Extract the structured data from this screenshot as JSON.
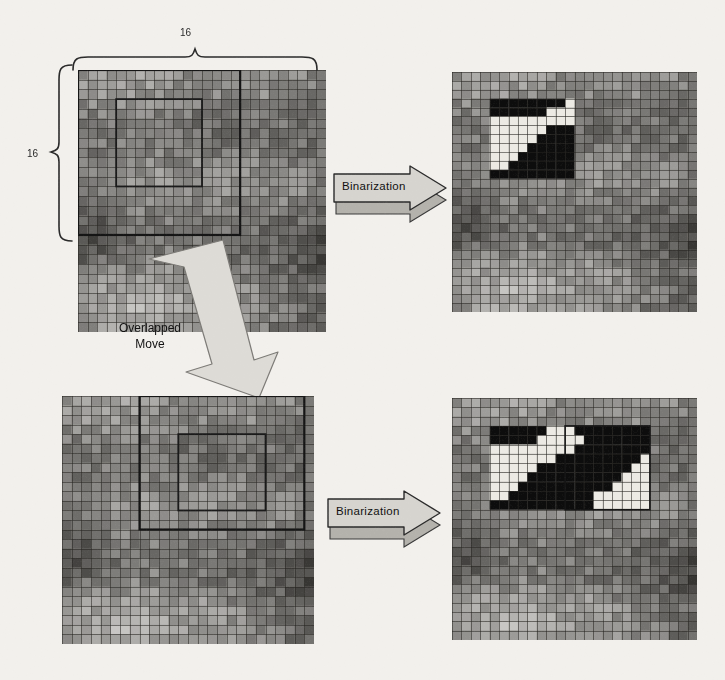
{
  "figure": {
    "background_color": "#f2f0ec",
    "ink_color": "#1d1d1d",
    "arrow_fill": "#c9c7c2",
    "arrow_stroke": "#2a2a2a",
    "panel_border": "#202020"
  },
  "dimensions": {
    "width_label": "16",
    "height_label": "16"
  },
  "labels": {
    "binarization_top": "Binarization",
    "binarization_bottom": "Binarization",
    "overlapped_line1": "Overlapped",
    "overlapped_line2": "Move"
  },
  "panels": [
    {
      "id": "source-top",
      "name": "top-left-source-grid",
      "role": "grayscale texture with 16x16 analysis window",
      "x": 78,
      "y": 70,
      "w": 248,
      "h": 262,
      "grid_cols": 26,
      "grid_rows": 27,
      "window": {
        "x": 0,
        "y": 0,
        "w": 17,
        "h": 17,
        "label": "16x16 window"
      },
      "inner_box": {
        "x": 4,
        "y": 3,
        "w": 9,
        "h": 9
      }
    },
    {
      "id": "result-top",
      "name": "top-right-binarized-grid",
      "role": "binarized result of the top window",
      "x": 452,
      "y": 72,
      "w": 245,
      "h": 240,
      "grid_cols": 26,
      "grid_rows": 27,
      "binary_box": {
        "x": 4,
        "y": 3,
        "w": 9,
        "h": 9
      }
    },
    {
      "id": "source-bottom",
      "name": "bottom-left-source-grid",
      "role": "grayscale texture after overlapped move of the window",
      "x": 62,
      "y": 396,
      "w": 252,
      "h": 248,
      "grid_cols": 26,
      "grid_rows": 26,
      "window": {
        "x": 8,
        "y": 0,
        "w": 17,
        "h": 14,
        "label": "moved 16x16 window"
      },
      "inner_box": {
        "x": 12,
        "y": 4,
        "w": 9,
        "h": 8
      }
    },
    {
      "id": "result-bottom",
      "name": "bottom-right-binarized-grid",
      "role": "binarized result of the two overlapped windows",
      "x": 452,
      "y": 398,
      "w": 245,
      "h": 242,
      "grid_cols": 26,
      "grid_rows": 26,
      "binary_box": {
        "x": 4,
        "y": 3,
        "w": 17,
        "h": 9
      },
      "second_window_box": {
        "x": 12,
        "y": 3,
        "w": 9,
        "h": 9
      }
    }
  ],
  "chart_data": {
    "type": "heatmap",
    "cell_values_legend": {
      "black": 0,
      "white": 1
    },
    "binary_top": [
      [
        0,
        0,
        0,
        0,
        0,
        0,
        0,
        0,
        1
      ],
      [
        0,
        0,
        0,
        0,
        0,
        0,
        1,
        1,
        1
      ],
      [
        1,
        1,
        1,
        1,
        1,
        1,
        1,
        1,
        1
      ],
      [
        1,
        1,
        1,
        1,
        1,
        1,
        0,
        0,
        0
      ],
      [
        1,
        1,
        1,
        1,
        1,
        0,
        0,
        0,
        0
      ],
      [
        1,
        1,
        1,
        1,
        0,
        0,
        0,
        0,
        0
      ],
      [
        1,
        1,
        1,
        0,
        0,
        0,
        0,
        0,
        0
      ],
      [
        1,
        1,
        0,
        0,
        0,
        0,
        0,
        0,
        0
      ],
      [
        0,
        0,
        0,
        0,
        0,
        0,
        0,
        0,
        0
      ]
    ],
    "binary_bottom": [
      [
        0,
        0,
        0,
        0,
        0,
        0,
        1,
        1,
        1,
        0,
        0,
        0,
        0,
        0,
        0,
        0,
        0
      ],
      [
        0,
        0,
        0,
        0,
        0,
        1,
        1,
        1,
        1,
        1,
        0,
        0,
        0,
        0,
        0,
        0,
        0
      ],
      [
        1,
        1,
        1,
        1,
        1,
        1,
        1,
        1,
        1,
        0,
        0,
        0,
        0,
        0,
        0,
        0,
        0
      ],
      [
        1,
        1,
        1,
        1,
        1,
        1,
        1,
        0,
        0,
        0,
        0,
        0,
        0,
        0,
        0,
        0,
        1
      ],
      [
        1,
        1,
        1,
        1,
        1,
        0,
        0,
        0,
        0,
        0,
        0,
        0,
        0,
        0,
        0,
        1,
        1
      ],
      [
        1,
        1,
        1,
        1,
        0,
        0,
        0,
        0,
        0,
        0,
        0,
        0,
        0,
        0,
        1,
        1,
        1
      ],
      [
        1,
        1,
        1,
        0,
        0,
        0,
        0,
        0,
        0,
        0,
        0,
        0,
        0,
        1,
        1,
        1,
        1
      ],
      [
        1,
        1,
        0,
        0,
        0,
        0,
        0,
        0,
        0,
        0,
        0,
        1,
        1,
        1,
        1,
        1,
        1
      ],
      [
        0,
        0,
        0,
        0,
        0,
        0,
        0,
        0,
        0,
        0,
        0,
        1,
        1,
        1,
        1,
        1,
        1
      ]
    ],
    "xlabel": "16",
    "ylabel": "16",
    "grid": true,
    "legend_position": "none"
  }
}
